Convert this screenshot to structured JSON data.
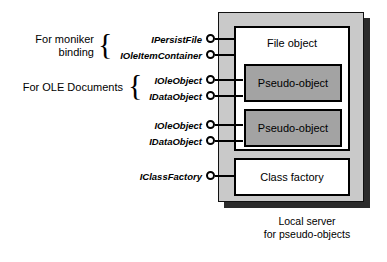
{
  "diagram": {
    "server": {
      "caption_line1": "Local server",
      "caption_line2": "for pseudo-objects",
      "fill_color": "#c9c9c9",
      "shadow_color": "#2b2b2b"
    },
    "boxes": [
      {
        "id": "file-object",
        "label": "File object",
        "fill_color": "#ffffff"
      },
      {
        "id": "pseudo-object-1",
        "label": "Pseudo-object",
        "fill_color": "#a3a3a3"
      },
      {
        "id": "pseudo-object-2",
        "label": "Pseudo-object",
        "fill_color": "#a3a3a3"
      },
      {
        "id": "class-factory",
        "label": "Class factory",
        "fill_color": "#ffffff"
      }
    ],
    "groups": [
      {
        "id": "moniker-binding",
        "label_line1": "For moniker",
        "label_line2": "binding",
        "brace": "{"
      },
      {
        "id": "ole-documents",
        "label_line1": "For OLE Documents",
        "label_line2": "",
        "brace": "{"
      }
    ],
    "interfaces": [
      {
        "id": "ipersistfile",
        "label": "IPersistFile",
        "target": "file-object"
      },
      {
        "id": "ioleitemcontainer",
        "label": "IOleItemContainer",
        "target": "file-object"
      },
      {
        "id": "ioleobject-1",
        "label": "IOleObject",
        "target": "pseudo-object-1"
      },
      {
        "id": "idataobject-1",
        "label": "IDataObject",
        "target": "pseudo-object-1"
      },
      {
        "id": "ioleobject-2",
        "label": "IOleObject",
        "target": "pseudo-object-2"
      },
      {
        "id": "idataobject-2",
        "label": "IDataObject",
        "target": "pseudo-object-2"
      },
      {
        "id": "iclassfactory",
        "label": "IClassFactory",
        "target": "class-factory"
      }
    ]
  }
}
